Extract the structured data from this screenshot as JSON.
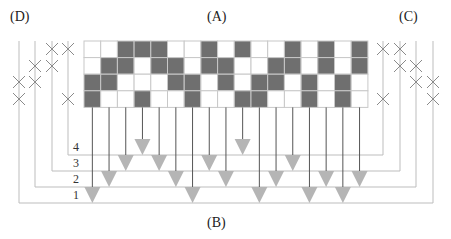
{
  "labels": {
    "A": "(A)",
    "B": "(B)",
    "C": "(C)",
    "D": "(D)"
  },
  "bus_numbers": [
    "1",
    "2",
    "3",
    "4"
  ],
  "colors": {
    "filled_cell": "#6f6f6f",
    "empty_cell": "#ffffff",
    "grid_line": "#c8c8c8",
    "thin_line": "#bdbdbd",
    "drop_line": "#555555",
    "triangle": "#b5b5b5",
    "cross": "#8a8a8a"
  },
  "grid": {
    "x0": 84,
    "y0": 41,
    "cell_w": 16.7,
    "cell_h": 16.6,
    "rows": [
      [
        0,
        0,
        1,
        1,
        1,
        0,
        0,
        1,
        0,
        1,
        0,
        0,
        1,
        0,
        1,
        0,
        1
      ],
      [
        0,
        1,
        1,
        0,
        1,
        1,
        0,
        1,
        1,
        0,
        0,
        1,
        1,
        0,
        1,
        0,
        1
      ],
      [
        1,
        1,
        0,
        0,
        0,
        1,
        1,
        0,
        1,
        0,
        1,
        1,
        0,
        1,
        0,
        1,
        0
      ],
      [
        1,
        0,
        0,
        1,
        0,
        0,
        1,
        0,
        0,
        1,
        1,
        0,
        0,
        1,
        0,
        1,
        0
      ]
    ]
  },
  "left_matrix_D": {
    "line_x": [
      19,
      35,
      52,
      68
    ],
    "crosses": [
      [
        52,
        49
      ],
      [
        68,
        49
      ],
      [
        35,
        66
      ],
      [
        52,
        66
      ],
      [
        19,
        82
      ],
      [
        35,
        82
      ],
      [
        19,
        99
      ],
      [
        68,
        99
      ]
    ]
  },
  "right_matrix_C": {
    "line_x": [
      383,
      400,
      416,
      433
    ],
    "crosses": [
      [
        383,
        49
      ],
      [
        400,
        49
      ],
      [
        400,
        66
      ],
      [
        416,
        66
      ],
      [
        416,
        82
      ],
      [
        433,
        82
      ],
      [
        383,
        99
      ],
      [
        433,
        99
      ]
    ]
  },
  "buses": [
    {
      "number": "4",
      "y": 155,
      "x_left": 68,
      "x_right": 383,
      "columns": [
        3,
        9
      ]
    },
    {
      "number": "3",
      "y": 171,
      "x_left": 52,
      "x_right": 400,
      "columns": [
        2,
        4,
        7,
        12
      ]
    },
    {
      "number": "2",
      "y": 187,
      "x_left": 35,
      "x_right": 416,
      "columns": [
        1,
        5,
        8,
        11,
        14,
        16
      ]
    },
    {
      "number": "1",
      "y": 203,
      "x_left": 19,
      "x_right": 433,
      "columns": [
        0,
        6,
        10,
        13,
        15
      ]
    }
  ]
}
